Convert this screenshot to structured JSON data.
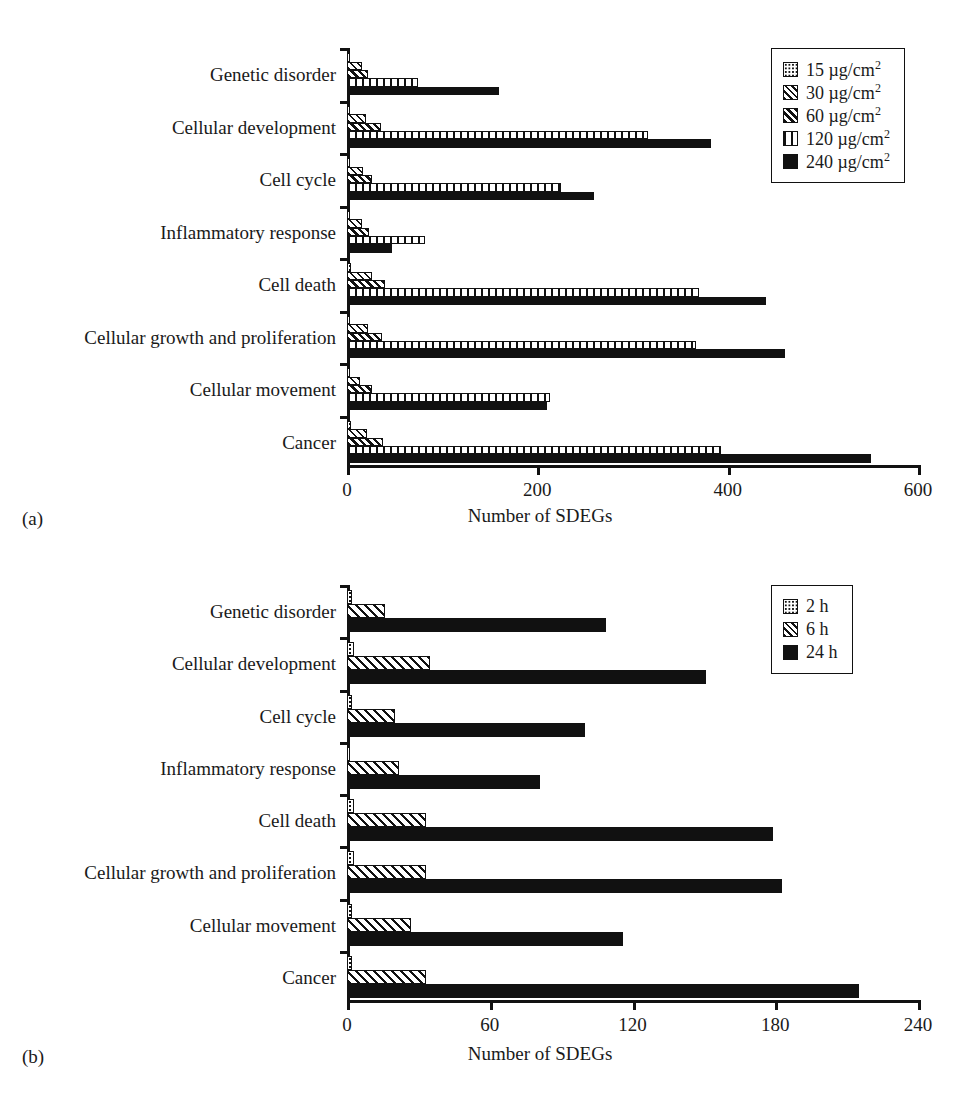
{
  "figure": {
    "panels": [
      {
        "tag": "(a)",
        "xlabel": "Number of SDEGs",
        "legend_title": "",
        "legend": [
          {
            "label": "15 µg/cm",
            "sup": "2"
          },
          {
            "label": "30 µg/cm",
            "sup": "2"
          },
          {
            "label": "60 µg/cm",
            "sup": "2"
          },
          {
            "label": "120 µg/cm",
            "sup": "2"
          },
          {
            "label": "240 µg/cm",
            "sup": "2"
          }
        ]
      },
      {
        "tag": "(b)",
        "xlabel": "Number of SDEGs",
        "legend_title": "",
        "legend": [
          {
            "label": "2 h",
            "sup": ""
          },
          {
            "label": "6 h",
            "sup": ""
          },
          {
            "label": "24 h",
            "sup": ""
          }
        ]
      }
    ]
  },
  "chart_data": [
    {
      "type": "bar",
      "orientation": "horizontal",
      "title": "",
      "panel": "(a)",
      "xlabel": "Number of SDEGs",
      "ylabel": "",
      "xlim": [
        0,
        600
      ],
      "xticks": [
        0,
        200,
        400,
        600
      ],
      "grid": false,
      "legend_position": "top-right",
      "categories": [
        "Genetic disorder",
        "Cellular development",
        "Cell cycle",
        "Inflammatory response",
        "Cell death",
        "Cellular growth and proliferation",
        "Cellular movement",
        "Cancer"
      ],
      "series": [
        {
          "name": "15 µg/cm2",
          "values": [
            3,
            3,
            2,
            3,
            4,
            3,
            3,
            4
          ]
        },
        {
          "name": "30 µg/cm2",
          "values": [
            16,
            20,
            17,
            16,
            26,
            22,
            14,
            21
          ]
        },
        {
          "name": "60 µg/cm2",
          "values": [
            22,
            36,
            26,
            23,
            40,
            37,
            26,
            38
          ]
        },
        {
          "name": "120 µg/cm2",
          "values": [
            75,
            316,
            225,
            82,
            370,
            367,
            213,
            393
          ]
        },
        {
          "name": "240 µg/cm2",
          "values": [
            160,
            383,
            260,
            47,
            440,
            460,
            210,
            551
          ]
        }
      ]
    },
    {
      "type": "bar",
      "orientation": "horizontal",
      "title": "",
      "panel": "(b)",
      "xlabel": "Number of SDEGs",
      "ylabel": "",
      "xlim": [
        0,
        240
      ],
      "xticks": [
        0,
        60,
        120,
        180,
        240
      ],
      "grid": false,
      "legend_position": "top-right",
      "categories": [
        "Genetic disorder",
        "Cellular development",
        "Cell cycle",
        "Inflammatory response",
        "Cell death",
        "Cellular growth and proliferation",
        "Cellular movement",
        "Cancer"
      ],
      "series": [
        {
          "name": "2 h",
          "values": [
            2,
            3,
            2,
            1,
            3,
            3,
            2,
            2
          ]
        },
        {
          "name": "6 h",
          "values": [
            16,
            35,
            20,
            22,
            33,
            33,
            27,
            33
          ]
        },
        {
          "name": "24 h",
          "values": [
            109,
            151,
            100,
            81,
            179,
            183,
            116,
            215
          ]
        }
      ]
    }
  ]
}
